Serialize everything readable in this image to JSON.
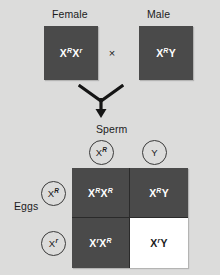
{
  "diagram": {
    "background_color": "#dcdcdb",
    "box_color": "#4a4a4a",
    "affected_cell_color": "#ffffff"
  },
  "parents": {
    "female": {
      "header": "Female",
      "allele_1": "X",
      "allele_1_sup": "R",
      "allele_2": "X",
      "allele_2_sup": "r"
    },
    "male": {
      "header": "Male",
      "allele_1": "X",
      "allele_1_sup": "R",
      "allele_2": "Y",
      "allele_2_sup": ""
    },
    "cross_symbol": "×"
  },
  "gametes": {
    "sperm_label": "Sperm",
    "eggs_label": "Eggs",
    "sperm": [
      {
        "base": "X",
        "sup": "R"
      },
      {
        "base": "Y",
        "sup": ""
      }
    ],
    "eggs": [
      {
        "base": "X",
        "sup": "R"
      },
      {
        "base": "X",
        "sup": "r"
      }
    ]
  },
  "punnett": {
    "cells": [
      {
        "a_base": "X",
        "a_sup": "R",
        "b_base": "X",
        "b_sup": "R",
        "affected": false
      },
      {
        "a_base": "X",
        "a_sup": "R",
        "b_base": "Y",
        "b_sup": "",
        "affected": false
      },
      {
        "a_base": "X",
        "a_sup": "r",
        "b_base": "X",
        "b_sup": "R",
        "affected": false
      },
      {
        "a_base": "X",
        "a_sup": "r",
        "b_base": "Y",
        "b_sup": "",
        "affected": true
      }
    ]
  }
}
